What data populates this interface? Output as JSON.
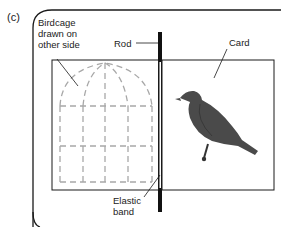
{
  "figure": {
    "panel_label": "(c)",
    "labels": {
      "birdcage": "Birdcage\ndrawn on\nother side",
      "rod": "Rod",
      "card": "Card",
      "elastic_band": "Elastic\nband"
    },
    "colors": {
      "line": "#1a1a1a",
      "cage_dashes": "#a8a8a8",
      "bird_fill": "#4a4a4a",
      "rod": "#111111"
    }
  }
}
